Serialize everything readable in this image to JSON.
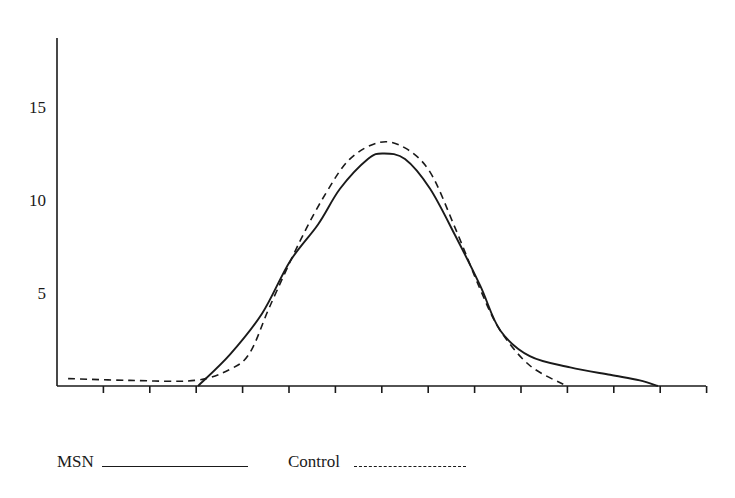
{
  "chart_data": {
    "type": "line",
    "title": "",
    "xlabel": "",
    "ylabel": "",
    "xlim": [
      0,
      14
    ],
    "ylim": [
      0,
      18.7
    ],
    "x_ticks": [
      1,
      2,
      3,
      4,
      5,
      6,
      7,
      8,
      9,
      10,
      11,
      12,
      13,
      14
    ],
    "x_tick_labels": [],
    "y_ticks": [
      5,
      10,
      15
    ],
    "y_tick_labels": [
      "5",
      "10",
      "15"
    ],
    "grid": false,
    "legend_position": "bottom-left",
    "series": [
      {
        "name": "MSN",
        "style": "solid",
        "x": [
          3.04,
          3.73,
          4.42,
          5.02,
          5.63,
          6.1,
          6.7,
          7.03,
          7.5,
          8.04,
          8.58,
          9.12,
          9.55,
          10.19,
          11.06,
          11.92,
          12.56,
          12.95
        ],
        "y": [
          0,
          1.7,
          3.9,
          6.7,
          8.7,
          10.6,
          12.2,
          12.5,
          12.2,
          10.6,
          8.1,
          5.4,
          3.0,
          1.6,
          1.0,
          0.6,
          0.3,
          0
        ]
      },
      {
        "name": "Control",
        "style": "dashed",
        "x": [
          0.24,
          1.57,
          2.97,
          3.73,
          4.16,
          4.59,
          5.24,
          5.78,
          6.31,
          6.96,
          7.5,
          8.04,
          8.58,
          9.12,
          9.55,
          10.19,
          10.99
        ],
        "y": [
          0.4,
          0.3,
          0.3,
          0.9,
          1.8,
          4.3,
          7.8,
          10.3,
          12.2,
          13.1,
          12.8,
          11.5,
          8.5,
          5.2,
          3.0,
          1.1,
          0
        ]
      }
    ]
  },
  "legend": {
    "items": [
      {
        "label": "MSN",
        "style": "solid"
      },
      {
        "label": "Control",
        "style": "dashed"
      }
    ]
  },
  "colors": {
    "ink": "#1a1a1a",
    "background": "#ffffff"
  }
}
